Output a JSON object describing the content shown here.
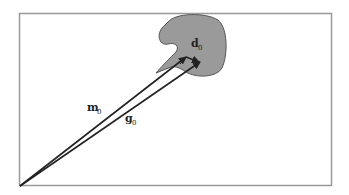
{
  "diagram": {
    "frame": {
      "x": 19,
      "y": 13,
      "width": 313,
      "height": 173,
      "stroke": "#999999"
    },
    "blob": {
      "fill": "#999999",
      "stroke": "#555555"
    },
    "vectors": [
      {
        "name": "m",
        "subscript": "0",
        "label": "m",
        "from": [
          20,
          186
        ],
        "to": [
          187,
          57
        ]
      },
      {
        "name": "g",
        "subscript": "0",
        "label": "g",
        "from": [
          20,
          186
        ],
        "to": [
          201,
          62
        ]
      },
      {
        "name": "d",
        "subscript": "0",
        "label": "d",
        "from": [
          187,
          57
        ],
        "to": [
          201,
          62
        ]
      }
    ],
    "labels": {
      "m": "m",
      "m_sub": "0",
      "g": "g",
      "g_sub": "0",
      "d": "d",
      "d_sub": "0"
    }
  }
}
